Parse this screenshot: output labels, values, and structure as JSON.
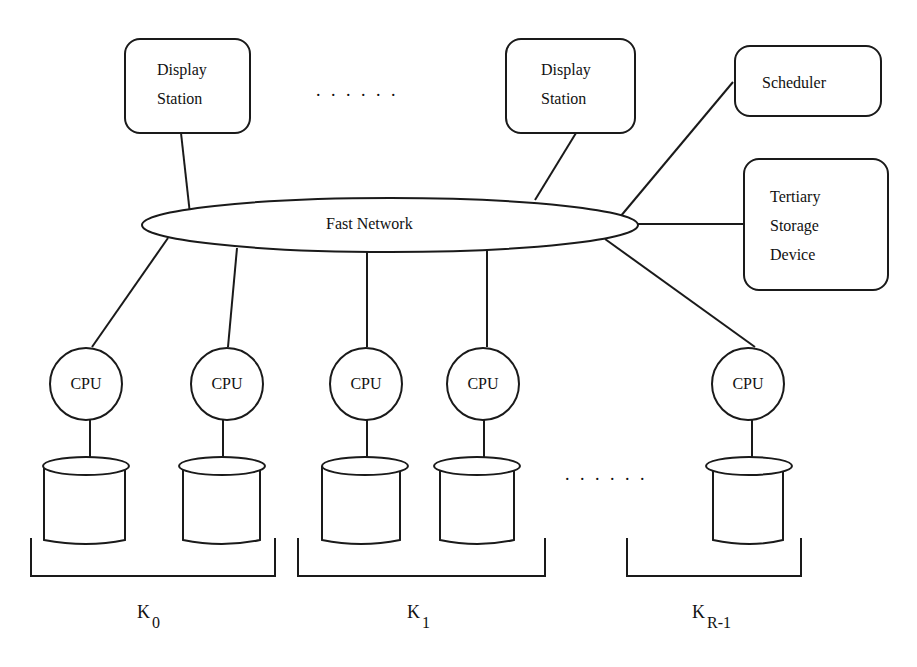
{
  "diagram": {
    "display_stations": [
      {
        "line1": "Display",
        "line2": "Station"
      },
      {
        "line1": "Display",
        "line2": "Station"
      }
    ],
    "top_ellipsis": ". . . . . .",
    "scheduler": {
      "label": "Scheduler"
    },
    "tertiary_storage": {
      "line1": "Tertiary",
      "line2": "Storage",
      "line3": "Device"
    },
    "network": {
      "label": "Fast Network"
    },
    "cpus": [
      {
        "label": "CPU"
      },
      {
        "label": "CPU"
      },
      {
        "label": "CPU"
      },
      {
        "label": "CPU"
      },
      {
        "label": "CPU"
      }
    ],
    "bottom_ellipsis": ". . . . . .",
    "clusters": [
      {
        "base": "K",
        "sub": "0"
      },
      {
        "base": "K",
        "sub": "1"
      },
      {
        "base": "K",
        "sub": "R-1"
      }
    ],
    "colors": {
      "stroke": "#1a1a1a",
      "background": "#ffffff"
    }
  }
}
